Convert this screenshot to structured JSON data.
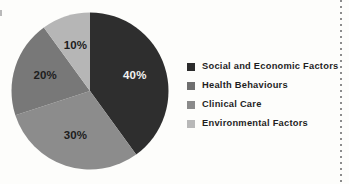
{
  "chart_data": {
    "type": "pie",
    "title": "",
    "subtitle": "",
    "xlabel": "",
    "ylabel": "",
    "legend_position": "right",
    "grid": false,
    "start_angle_deg": 0,
    "direction": "clockwise",
    "categories": [
      "Social and Economic Factors",
      "Health Behaviours",
      "Clinical Care",
      "Environmental Factors"
    ],
    "values": [
      40,
      30,
      20,
      10
    ],
    "value_labels": [
      "40%",
      "30%",
      "20%",
      "10%"
    ],
    "colors": [
      "#2e2e2e",
      "#8c8c8c",
      "#787878",
      "#b6b6b6"
    ],
    "slices": [
      {
        "label": "Social and Economic Factors",
        "value": 40,
        "value_label": "40%",
        "color": "#2e2e2e",
        "label_color": "on-dark"
      },
      {
        "label": "Health Behaviours",
        "value": 30,
        "value_label": "30%",
        "color": "#8c8c8c",
        "label_color": "on-light"
      },
      {
        "label": "Clinical Care",
        "value": 20,
        "value_label": "20%",
        "color": "#787878",
        "label_color": "on-light"
      },
      {
        "label": "Environmental Factors",
        "value": 10,
        "value_label": "10%",
        "color": "#b6b6b6",
        "label_color": "on-light"
      }
    ]
  },
  "legend": {
    "items": [
      {
        "label": "Social and Economic Factors",
        "color": "#2b2b2b"
      },
      {
        "label": "Health Behaviours",
        "color": "#6e6e6e"
      },
      {
        "label": "Clinical Care",
        "color": "#8a8a8a"
      },
      {
        "label": "Environmental Factors",
        "color": "#b8b8b8"
      }
    ]
  },
  "page": {
    "background_color": "#fdfdfb",
    "rule_color": "#8c8c8c"
  }
}
